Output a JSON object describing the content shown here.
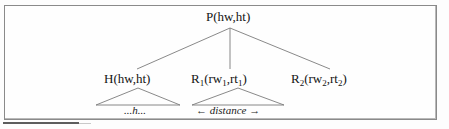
{
  "figure": {
    "type": "syntax-tree-diagram",
    "frame": {
      "border_color": "#8a8a8a",
      "background": "#fefefe"
    },
    "tree": {
      "root": {
        "id": "P",
        "label": "P(hw,ht)",
        "apex_x": 230,
        "apex_y": 27
      },
      "children": [
        {
          "id": "H",
          "label_plain": "H(hw,ht)",
          "label_base": "H(hw,ht)",
          "leaf": {
            "text": "...h...",
            "style": "italic"
          }
        },
        {
          "id": "R1",
          "label_plain": "R1(rw1,rt1)",
          "label_base": "R",
          "sub1": "1",
          "label_mid": "(rw",
          "sub2": "1",
          "label_sep": ",rt",
          "sub3": "1",
          "label_end": ")",
          "leaf": {
            "text_prefix": "←",
            "text": "distance",
            "text_suffix": "→",
            "style": "italic"
          }
        },
        {
          "id": "R2",
          "label_plain": "R2(rw2,rt2)",
          "label_base": "R",
          "sub1": "2",
          "label_mid": "(rw",
          "sub2": "2",
          "label_sep": ",rt",
          "sub3": "2",
          "label_end": ")",
          "leaf": null
        }
      ],
      "edge_color": "#7c7c7c",
      "triangle_color": "#7c7c7c"
    },
    "bottom_rule": {
      "color": "#5d5d5d"
    }
  }
}
